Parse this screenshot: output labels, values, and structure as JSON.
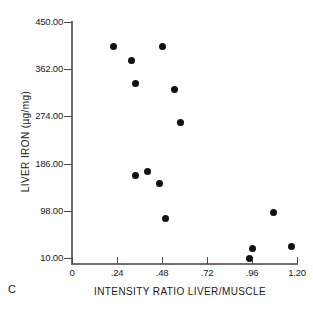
{
  "panel": {
    "label": "C"
  },
  "chart_data": {
    "type": "scatter",
    "title": "",
    "subtitle": "",
    "xlabel": "INTENSITY RATIO LIVER/MUSCLE",
    "ylabel": "LIVER IRON (µg/mg)",
    "xlim": [
      0,
      1.2
    ],
    "ylim": [
      10,
      450
    ],
    "grid": false,
    "legend": null,
    "xticks": [
      0,
      0.24,
      0.48,
      0.72,
      0.96,
      1.2
    ],
    "xticklabels": [
      "0",
      ".24",
      ".48",
      ".72",
      ".96",
      "1.20"
    ],
    "yticks": [
      10,
      98,
      186,
      274,
      362,
      450
    ],
    "yticklabels": [
      "10.00",
      "98.00",
      "186.00",
      "274.00",
      "362.00",
      "450.00"
    ],
    "marker": "filled-circle",
    "marker_color": "#111111",
    "points": [
      {
        "x": 0.22,
        "y": 405
      },
      {
        "x": 0.485,
        "y": 405
      },
      {
        "x": 0.315,
        "y": 378
      },
      {
        "x": 0.336,
        "y": 335
      },
      {
        "x": 0.544,
        "y": 324
      },
      {
        "x": 0.576,
        "y": 262
      },
      {
        "x": 0.405,
        "y": 171
      },
      {
        "x": 0.336,
        "y": 163
      },
      {
        "x": 0.469,
        "y": 148
      },
      {
        "x": 0.496,
        "y": 84
      },
      {
        "x": 1.077,
        "y": 94
      },
      {
        "x": 0.965,
        "y": 27
      },
      {
        "x": 0.944,
        "y": 10
      },
      {
        "x": 1.173,
        "y": 31
      }
    ],
    "axis_color": "#6e6e6e"
  }
}
